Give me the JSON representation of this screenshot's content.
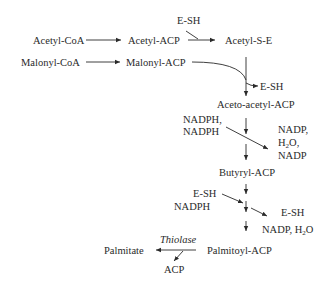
{
  "nodes": {
    "acetyl_coa": "Acetyl-CoA",
    "acetyl_acp": "Acetyl-ACP",
    "esh_1": "E-SH",
    "acetyl_s_e": "Acetyl-S-E",
    "malonyl_coa": "Malonyl-CoA",
    "malonyl_acp": "Malonyl-ACP",
    "esh_2": "E-SH",
    "acetoacetyl_acp": "Aceto-acetyl-ACP",
    "nadph_1": "NADPH,",
    "nadph_2": "NADPH",
    "nadp_1": "NADP,",
    "h2o_1_main": "H",
    "h2o_1_sub": "2",
    "h2o_1_end": "O,",
    "nadp_2": "NADP",
    "butyryl_acp": "Butyryl-ACP",
    "esh_3": "E-SH",
    "nadph_3": "NADPH",
    "esh_4": "E-SH",
    "nadp_h2o_main": "NADP, H",
    "nadp_h2o_sub": "2",
    "nadp_h2o_end": "O",
    "palmitoyl_acp": "Palmitoyl-ACP",
    "thiolase": "Thiolase",
    "palmitate": "Palmitate",
    "acp": "ACP"
  }
}
